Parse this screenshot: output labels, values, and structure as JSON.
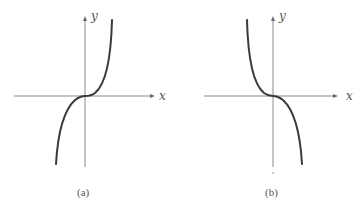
{
  "figure": {
    "panels": [
      {
        "id": "a",
        "caption": "(a)",
        "x_label": "x",
        "y_label": "y",
        "curve_shape": "increasing cubic (y = x^3)"
      },
      {
        "id": "b",
        "caption": "(b)",
        "x_label": "x",
        "y_label": "y",
        "curve_shape": "decreasing cubic (y = -x^3)"
      }
    ],
    "colors": {
      "axis": "#8a8a8a",
      "curve": "#3a3a3a",
      "text": "#555555"
    }
  }
}
